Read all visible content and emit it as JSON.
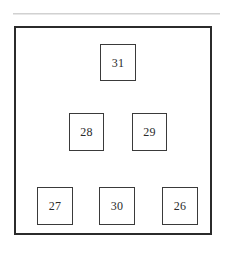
{
  "diagram": {
    "title": "",
    "background_color": "#ffffff",
    "frame": {
      "label": "outer-boundary",
      "x": 14,
      "y": 26,
      "width": 198,
      "height": 209,
      "stroke_color": "#2b2b2b",
      "stroke_width": 2,
      "fill_color": "#ffffff"
    },
    "artifact": {
      "label": "scan-line",
      "x": 13,
      "y": 13,
      "width": 207,
      "height": 2,
      "color": "#c9c9c9"
    },
    "node_style": {
      "stroke_color": "#3a3a3a",
      "stroke_width": 1,
      "fill_color": "#ffffff",
      "text_color": "#2a2a2a"
    },
    "rows": [
      {
        "row_index": 0,
        "nodes": [
          {
            "label": "31",
            "x": 100,
            "y": 44,
            "width": 36,
            "height": 37
          }
        ]
      },
      {
        "row_index": 1,
        "nodes": [
          {
            "label": "28",
            "x": 69,
            "y": 113,
            "width": 35,
            "height": 38
          },
          {
            "label": "29",
            "x": 132,
            "y": 113,
            "width": 35,
            "height": 38
          }
        ]
      },
      {
        "row_index": 2,
        "nodes": [
          {
            "label": "27",
            "x": 37,
            "y": 187,
            "width": 36,
            "height": 38
          },
          {
            "label": "30",
            "x": 99,
            "y": 187,
            "width": 36,
            "height": 38
          },
          {
            "label": "26",
            "x": 162,
            "y": 187,
            "width": 36,
            "height": 38
          }
        ]
      }
    ]
  }
}
